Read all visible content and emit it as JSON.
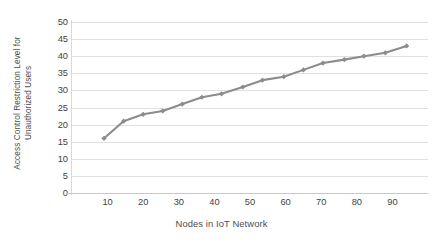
{
  "chart_data": {
    "type": "line",
    "title": "",
    "xlabel": "Nodes in IoT Network",
    "ylabel": "Access Control Restriction Level for Unauthorized Users",
    "ylabel_line1": "Access Control Restriction Level for",
    "ylabel_line2": "Unauthorized Users",
    "xlim": [
      0,
      100
    ],
    "ylim": [
      0,
      50
    ],
    "xticks": [
      10,
      20,
      30,
      40,
      50,
      60,
      70,
      80,
      90
    ],
    "yticks": [
      0,
      5,
      10,
      15,
      20,
      25,
      30,
      35,
      40,
      45,
      50
    ],
    "grid": "horizontal",
    "legend": "none",
    "series": [
      {
        "name": "Access Control Restriction Level",
        "color": "#8c8c8c",
        "marker": "diamond",
        "x": [
          9,
          14.5,
          20,
          25.5,
          31,
          36.5,
          42,
          48,
          53.5,
          59.5,
          65,
          70.5,
          76.5,
          82,
          88,
          94
        ],
        "values": [
          16,
          21,
          23,
          24,
          26,
          28,
          29,
          31,
          33,
          34,
          36,
          38,
          39,
          40,
          41,
          43
        ]
      }
    ]
  },
  "colors": {
    "line": "#8c8c8c",
    "marker": "#8c8c8c",
    "gridline": "#e0e0e0",
    "axis": "#c9c9c9",
    "text": "#3f3f3f",
    "title_text": "#4d4d4d",
    "background": "#ffffff"
  }
}
